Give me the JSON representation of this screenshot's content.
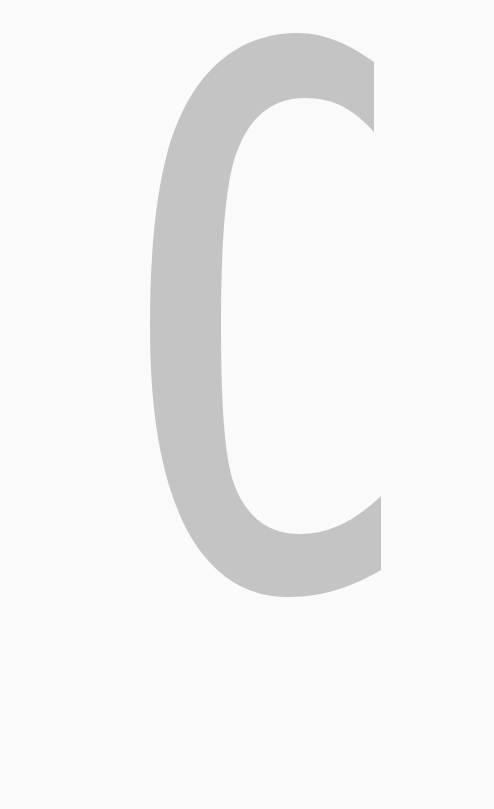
{
  "glyph": {
    "character": "C",
    "fill_color": "#c4c4c4",
    "background_color": "#fafafa"
  }
}
